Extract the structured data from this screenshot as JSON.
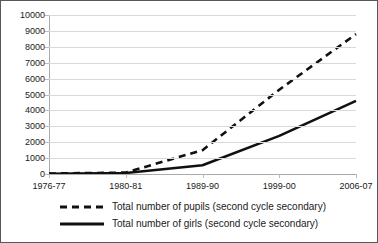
{
  "chart_data": {
    "type": "line",
    "title": "",
    "xlabel": "",
    "ylabel": "",
    "categories": [
      "1976-77",
      "1980-81",
      "1989-90",
      "1999-00",
      "2006-07"
    ],
    "ylim": [
      0,
      10000
    ],
    "ytick_values": [
      0,
      1000,
      2000,
      3000,
      4000,
      5000,
      6000,
      7000,
      8000,
      9000,
      10000
    ],
    "ytick_labels": [
      "0",
      "1000",
      "2000",
      "3000",
      "4000",
      "5000",
      "6000",
      "7000",
      "8000",
      "9000",
      "10000"
    ],
    "grid": true,
    "legend_position": "bottom",
    "series": [
      {
        "name": "Total number of pupils (second cycle secondary)",
        "style": "dashed",
        "color": "#111111",
        "values": [
          30,
          90,
          1500,
          5300,
          8800
        ]
      },
      {
        "name": "Total number of girls (second cycle secondary)",
        "style": "solid",
        "color": "#111111",
        "values": [
          20,
          60,
          550,
          2400,
          4600
        ]
      }
    ]
  },
  "legend": {
    "items": [
      {
        "label": "Total number of pupils (second cycle secondary)",
        "swatch": "dashed-line-swatch"
      },
      {
        "label": "Total number of girls (second cycle secondary)",
        "swatch": "solid-line-swatch"
      }
    ]
  }
}
